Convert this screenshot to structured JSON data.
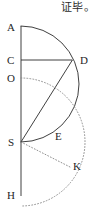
{
  "annotation": {
    "qed_text": "证毕。"
  },
  "figure": {
    "labels": [
      {
        "id": "A",
        "text": "A",
        "x": 7,
        "y": 22
      },
      {
        "id": "C",
        "text": "C",
        "x": 7,
        "y": 55
      },
      {
        "id": "O",
        "text": "O",
        "x": 7,
        "y": 73
      },
      {
        "id": "S",
        "text": "S",
        "x": 8,
        "y": 137
      },
      {
        "id": "H",
        "text": "H",
        "x": 7,
        "y": 190
      },
      {
        "id": "D",
        "text": "D",
        "x": 80,
        "y": 55
      },
      {
        "id": "E",
        "text": "E",
        "x": 55,
        "y": 131
      },
      {
        "id": "K",
        "text": "K",
        "x": 73,
        "y": 161
      }
    ],
    "points": {
      "A": {
        "x": 21,
        "y": 26
      },
      "C": {
        "x": 21,
        "y": 60
      },
      "O": {
        "x": 21,
        "y": 78
      },
      "S": {
        "x": 21,
        "y": 142
      },
      "H": {
        "x": 21,
        "y": 196
      },
      "D": {
        "x": 72,
        "y": 60
      },
      "K": {
        "x": 70,
        "y": 166
      }
    },
    "stroke_color": "#2a2a2a",
    "stroke_width": 0.9,
    "dotted_color": "#8a8a8a",
    "dot_pattern": "0.9 2.1",
    "arcs": [
      {
        "id": "arc-ADS",
        "center": "C",
        "radius": 51,
        "style": "solid",
        "from": "A",
        "to": "S"
      },
      {
        "id": "arc-OKH",
        "center": "S",
        "radius": 64,
        "style": "dotted",
        "from": "O",
        "to": "H"
      }
    ],
    "segments": [
      {
        "id": "line-AH",
        "from": "A",
        "to": "H",
        "style": "solid"
      },
      {
        "id": "line-CD",
        "from": "C",
        "to": "D",
        "style": "solid"
      },
      {
        "id": "line-SD",
        "from": "S",
        "to": "D",
        "style": "solid"
      },
      {
        "id": "line-SK",
        "from": "S",
        "to": "K",
        "style": "dotted"
      }
    ]
  }
}
